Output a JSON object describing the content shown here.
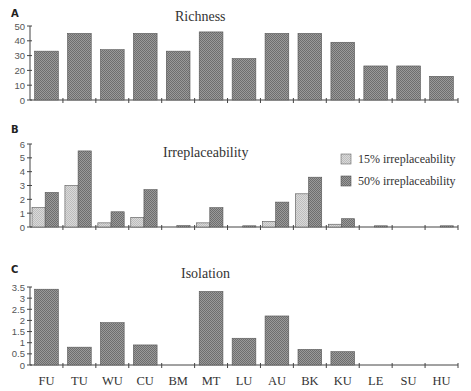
{
  "chart_data": [
    {
      "panel": "A",
      "type": "bar",
      "title": "Richness",
      "categories": [
        "FU",
        "TU",
        "WU",
        "CU",
        "BM",
        "MT",
        "LU",
        "AU",
        "BK",
        "KU",
        "LE",
        "SU",
        "HU"
      ],
      "values": [
        33,
        45,
        34,
        45,
        33,
        46,
        28,
        45,
        45,
        39,
        23,
        23,
        16
      ],
      "xlabel": "",
      "ylabel": "",
      "ylim": [
        0,
        50
      ],
      "yticks": [
        0,
        10,
        20,
        30,
        40,
        50
      ],
      "grid": false,
      "legend": null
    },
    {
      "panel": "B",
      "type": "bar",
      "title": "Irreplaceability",
      "categories": [
        "FU",
        "TU",
        "WU",
        "CU",
        "BM",
        "MT",
        "LU",
        "AU",
        "BK",
        "KU",
        "LE",
        "SU",
        "HU"
      ],
      "series": [
        {
          "name": "15% irreplaceability",
          "color": "#cfcfcf",
          "values": [
            1.4,
            3.0,
            0.3,
            0.7,
            0.0,
            0.3,
            0.0,
            0.4,
            2.4,
            0.2,
            0.0,
            0.0,
            0.0
          ]
        },
        {
          "name": "50% irreplaceability",
          "color": "#8c8c8c",
          "values": [
            2.5,
            5.5,
            1.1,
            2.7,
            0.1,
            1.4,
            0.05,
            1.8,
            3.6,
            0.6,
            0.05,
            0.0,
            0.05
          ]
        }
      ],
      "xlabel": "",
      "ylabel": "",
      "ylim": [
        0,
        6
      ],
      "yticks": [
        0,
        1,
        2,
        3,
        4,
        5,
        6
      ],
      "grid": false,
      "legend": "upper right"
    },
    {
      "panel": "C",
      "type": "bar",
      "title": "Isolation",
      "categories": [
        "FU",
        "TU",
        "WU",
        "CU",
        "BM",
        "MT",
        "LU",
        "AU",
        "BK",
        "KU",
        "LE",
        "SU",
        "HU"
      ],
      "values": [
        3.4,
        0.8,
        1.9,
        0.9,
        0.0,
        3.3,
        1.2,
        2.2,
        0.7,
        0.6,
        0.0,
        0.0,
        0.0
      ],
      "xlabel": "",
      "ylabel": "",
      "ylim": [
        0,
        3.5
      ],
      "yticks": [
        0,
        0.5,
        1,
        1.5,
        2,
        2.5,
        3,
        3.5
      ],
      "grid": false,
      "legend": null
    }
  ],
  "panels": {
    "a": {
      "letter": "A",
      "title": "Richness"
    },
    "b": {
      "letter": "B",
      "title": "Irreplaceability"
    },
    "c": {
      "letter": "C",
      "title": "Isolation"
    }
  },
  "legend": {
    "item_15": "15% irreplaceability",
    "item_50": "50% irreplaceability"
  },
  "colors": {
    "single_bar": "#8f8f8f",
    "light_bar": "#cfcfcf",
    "dark_bar": "#8c8c8c",
    "axis": "#444444"
  }
}
